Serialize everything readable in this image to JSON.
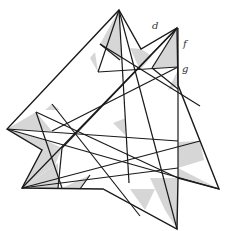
{
  "diagram": {
    "labels": [
      {
        "id": "d",
        "text": "d",
        "x": 154,
        "y": 29
      },
      {
        "id": "f",
        "text": "f",
        "x": 184,
        "y": 46
      },
      {
        "id": "g",
        "text": "g",
        "x": 183,
        "y": 71
      }
    ],
    "colors": {
      "line": "#1a1a1a",
      "shade": "#d6d6d6",
      "background": "#ffffff"
    },
    "outline": [
      [
        119,
        10
      ],
      [
        141,
        49
      ],
      [
        177,
        28
      ],
      [
        178,
        85
      ],
      [
        219,
        189
      ],
      [
        178,
        178
      ],
      [
        177,
        229
      ],
      [
        103,
        189
      ],
      [
        22,
        188
      ],
      [
        42,
        150
      ],
      [
        7,
        129
      ]
    ],
    "shaded_regions": [
      [
        [
          119,
          10
        ],
        [
          100,
          44
        ],
        [
          110,
          52
        ],
        [
          122,
          60
        ]
      ],
      [
        [
          141,
          49
        ],
        [
          130,
          48
        ],
        [
          140,
          70
        ],
        [
          152,
          56
        ]
      ],
      [
        [
          177,
          28
        ],
        [
          152,
          68
        ],
        [
          178,
          67
        ]
      ],
      [
        [
          178,
          70
        ],
        [
          168,
          90
        ],
        [
          178,
          85
        ]
      ],
      [
        [
          7,
          129
        ],
        [
          36,
          112
        ],
        [
          52,
          131
        ]
      ],
      [
        [
          7,
          129
        ],
        [
          45,
          140
        ],
        [
          62,
          148
        ],
        [
          42,
          150
        ]
      ],
      [
        [
          42,
          150
        ],
        [
          62,
          148
        ],
        [
          55,
          165
        ],
        [
          22,
          188
        ]
      ],
      [
        [
          22,
          188
        ],
        [
          58,
          163
        ],
        [
          58,
          188
        ]
      ],
      [
        [
          178,
          142
        ],
        [
          200,
          141
        ],
        [
          204,
          160
        ],
        [
          178,
          168
        ]
      ],
      [
        [
          178,
          168
        ],
        [
          219,
          189
        ],
        [
          178,
          178
        ]
      ],
      [
        [
          178,
          178
        ],
        [
          150,
          178
        ],
        [
          165,
          210
        ],
        [
          177,
          229
        ]
      ],
      [
        [
          130,
          189
        ],
        [
          145,
          210
        ],
        [
          155,
          189
        ]
      ],
      [
        [
          90,
          175
        ],
        [
          80,
          189
        ],
        [
          60,
          189
        ]
      ],
      [
        [
          113,
          123
        ],
        [
          126,
          118
        ],
        [
          125,
          135
        ]
      ],
      [
        [
          95,
          52
        ],
        [
          98,
          72
        ],
        [
          90,
          58
        ]
      ],
      [
        [
          52,
          104
        ],
        [
          60,
          110
        ],
        [
          45,
          110
        ]
      ]
    ],
    "lines": [
      [
        [
          119,
          10
        ],
        [
          177,
          229
        ]
      ],
      [
        [
          119,
          10
        ],
        [
          129,
          183
        ]
      ],
      [
        [
          119,
          10
        ],
        [
          98,
          72
        ]
      ],
      [
        [
          177,
          28
        ],
        [
          22,
          188
        ]
      ],
      [
        [
          177,
          28
        ],
        [
          62,
          148
        ]
      ],
      [
        [
          177,
          28
        ],
        [
          152,
          68
        ]
      ],
      [
        [
          7,
          129
        ],
        [
          219,
          189
        ]
      ],
      [
        [
          7,
          129
        ],
        [
          178,
          141
        ]
      ],
      [
        [
          36,
          112
        ],
        [
          178,
          178
        ]
      ],
      [
        [
          22,
          188
        ],
        [
          178,
          168
        ]
      ],
      [
        [
          22,
          188
        ],
        [
          200,
          141
        ]
      ],
      [
        [
          100,
          44
        ],
        [
          200,
          106
        ]
      ],
      [
        [
          52,
          131
        ],
        [
          178,
          67
        ]
      ],
      [
        [
          98,
          72
        ],
        [
          178,
          67
        ]
      ],
      [
        [
          52,
          104
        ],
        [
          140,
          216
        ]
      ],
      [
        [
          36,
          112
        ],
        [
          62,
          188
        ]
      ],
      [
        [
          62,
          148
        ],
        [
          58,
          188
        ]
      ],
      [
        [
          90,
          175
        ],
        [
          80,
          189
        ]
      ],
      [
        [
          100,
          44
        ],
        [
          120,
          60
        ]
      ],
      [
        [
          152,
          68
        ],
        [
          178,
          89
        ]
      ],
      [
        [
          178,
          28
        ],
        [
          178,
          178
        ]
      ]
    ]
  }
}
